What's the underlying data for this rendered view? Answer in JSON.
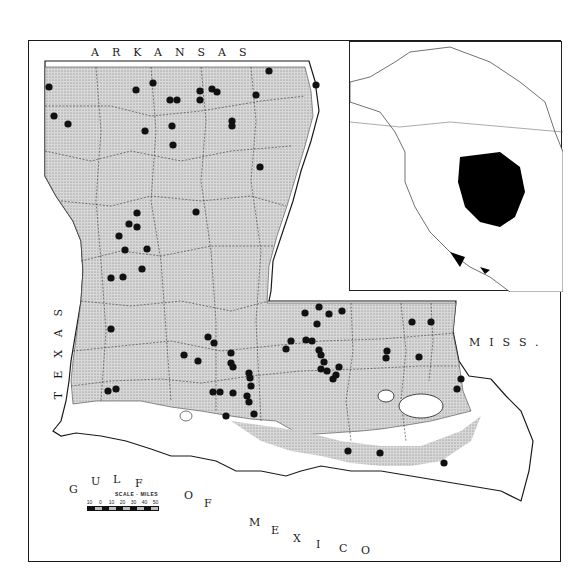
{
  "map": {
    "labels": {
      "arkansas": "ARKANSAS",
      "texas": "TEXAS",
      "miss": "MISS.",
      "gulf": [
        "G",
        "U",
        "L",
        "F"
      ],
      "of": [
        "O",
        "F"
      ],
      "mexico": [
        "M",
        "E",
        "X",
        "I",
        "C",
        "O"
      ]
    },
    "scale": {
      "title": "SCALE · MILES",
      "ticks": [
        "10",
        "0",
        "10",
        "20",
        "30",
        "40",
        "50"
      ]
    },
    "colors": {
      "range_fill": "#c9c9c9",
      "dot": "#111111",
      "border": "#1a1a1a",
      "inset_range": "#000000"
    },
    "record_points": [
      [
        48,
        86
      ],
      [
        53,
        115
      ],
      [
        67,
        123
      ],
      [
        135,
        89
      ],
      [
        152,
        82
      ],
      [
        169,
        99
      ],
      [
        176,
        99
      ],
      [
        171,
        125
      ],
      [
        144,
        130
      ],
      [
        172,
        144
      ],
      [
        199,
        90
      ],
      [
        199,
        99
      ],
      [
        211,
        88
      ],
      [
        216,
        91
      ],
      [
        255,
        94
      ],
      [
        268,
        70
      ],
      [
        231,
        120
      ],
      [
        231,
        125
      ],
      [
        315,
        84
      ],
      [
        259,
        166
      ],
      [
        195,
        211
      ],
      [
        136,
        212
      ],
      [
        128,
        223
      ],
      [
        136,
        226
      ],
      [
        118,
        235
      ],
      [
        124,
        249
      ],
      [
        146,
        248
      ],
      [
        110,
        277
      ],
      [
        122,
        276
      ],
      [
        141,
        268
      ],
      [
        110,
        328
      ],
      [
        107,
        390
      ],
      [
        115,
        388
      ],
      [
        207,
        336
      ],
      [
        213,
        342
      ],
      [
        183,
        354
      ],
      [
        197,
        360
      ],
      [
        230,
        352
      ],
      [
        230,
        362
      ],
      [
        232,
        366
      ],
      [
        212,
        391
      ],
      [
        219,
        391
      ],
      [
        232,
        392
      ],
      [
        248,
        372
      ],
      [
        249,
        377
      ],
      [
        250,
        385
      ],
      [
        246,
        395
      ],
      [
        248,
        401
      ],
      [
        253,
        413
      ],
      [
        225,
        415
      ],
      [
        304,
        312
      ],
      [
        318,
        306
      ],
      [
        328,
        313
      ],
      [
        341,
        310
      ],
      [
        316,
        323
      ],
      [
        285,
        348
      ],
      [
        290,
        340
      ],
      [
        305,
        339
      ],
      [
        311,
        340
      ],
      [
        318,
        349
      ],
      [
        320,
        354
      ],
      [
        323,
        361
      ],
      [
        320,
        368
      ],
      [
        326,
        370
      ],
      [
        332,
        378
      ],
      [
        335,
        374
      ],
      [
        338,
        366
      ],
      [
        386,
        350
      ],
      [
        385,
        357
      ],
      [
        411,
        321
      ],
      [
        430,
        321
      ],
      [
        418,
        356
      ],
      [
        460,
        378
      ],
      [
        456,
        388
      ],
      [
        347,
        450
      ],
      [
        379,
        452
      ],
      [
        443,
        462
      ]
    ]
  }
}
